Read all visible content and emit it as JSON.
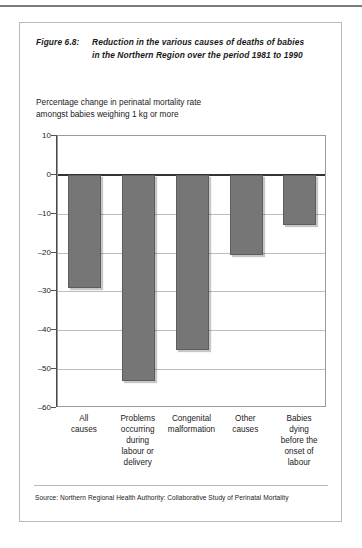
{
  "figure": {
    "number_label": "Figure 6.8:",
    "title_line1": "Reduction in the various causes of deaths of babies",
    "title_line2": "in the Northern Region over the period 1981 to 1990",
    "subtitle_line1": "Percentage change in perinatal mortality rate",
    "subtitle_line2": "amongst babies weighing 1 kg or more",
    "source": "Source: Northern Regional Health Authority: Collaborative Study of Perinatal Mortality"
  },
  "chart_data": {
    "type": "bar",
    "title": "Reduction in the various causes of deaths of babies in the Northern Region over the period 1981 to 1990",
    "subtitle": "Percentage change in perinatal mortality rate amongst babies weighing 1 kg or more",
    "xlabel": "",
    "ylabel": "",
    "ylim": [
      -60,
      10
    ],
    "yticks": [
      10,
      0,
      -10,
      -20,
      -30,
      -40,
      -50,
      -60
    ],
    "ytick_labels": [
      "10",
      "0",
      "-10",
      "-20",
      "-30",
      "-40",
      "-50",
      "-60"
    ],
    "grid": true,
    "legend": "none",
    "bar_color": "#767676",
    "categories": [
      "All causes",
      "Problems occurring during labour or delivery",
      "Congenital malformation",
      "Other causes",
      "Babies dying before the onset of labour"
    ],
    "category_lines": [
      [
        "All",
        "causes"
      ],
      [
        "Problems",
        "occurring",
        "during",
        "labour or",
        "delivery"
      ],
      [
        "Congenital",
        "malformation"
      ],
      [
        "Other",
        "causes"
      ],
      [
        "Babies",
        "dying",
        "before the",
        "onset of",
        "labour"
      ]
    ],
    "values": [
      -29,
      -53,
      -45,
      -20.5,
      -13
    ]
  }
}
